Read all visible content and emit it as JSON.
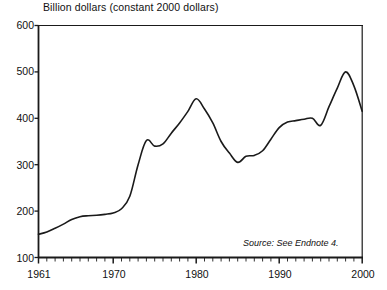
{
  "chart_data": {
    "type": "line",
    "title": "Billion dollars (constant 2000 dollars)",
    "xlabel": "",
    "ylabel": "",
    "xlim": [
      1961,
      2000
    ],
    "ylim": [
      100,
      600
    ],
    "yticks": [
      100,
      200,
      300,
      400,
      500,
      600
    ],
    "ytick_labels": [
      "100",
      "200",
      "300",
      "400",
      "500",
      "600"
    ],
    "xticks": [
      1961,
      1970,
      1980,
      1990,
      2000
    ],
    "xtick_labels": [
      "1961",
      "1970",
      "1980",
      "1990",
      "2000"
    ],
    "minor_xticks_every": 1,
    "grid": false,
    "legend": null,
    "line_color": "#1a1a1a",
    "line_width": 1.6,
    "annotation": "Source: See Endnote 4.",
    "x": [
      1961,
      1962,
      1963,
      1964,
      1965,
      1966,
      1967,
      1968,
      1969,
      1970,
      1971,
      1972,
      1973,
      1974,
      1975,
      1976,
      1977,
      1978,
      1979,
      1980,
      1981,
      1982,
      1983,
      1984,
      1985,
      1986,
      1987,
      1988,
      1989,
      1990,
      1991,
      1992,
      1993,
      1994,
      1995,
      1996,
      1997,
      1998,
      1999,
      2000
    ],
    "values": [
      150,
      155,
      163,
      172,
      182,
      188,
      190,
      191,
      193,
      196,
      205,
      232,
      300,
      352,
      340,
      345,
      368,
      390,
      415,
      442,
      420,
      390,
      350,
      325,
      305,
      318,
      320,
      330,
      355,
      380,
      392,
      395,
      398,
      400,
      385,
      425,
      465,
      500,
      470,
      415
    ],
    "series": [
      {
        "name": "Billion dollars (constant 2000 dollars)",
        "values": [
          150,
          155,
          163,
          172,
          182,
          188,
          190,
          191,
          193,
          196,
          205,
          232,
          300,
          352,
          340,
          345,
          368,
          390,
          415,
          442,
          420,
          390,
          350,
          325,
          305,
          318,
          320,
          330,
          355,
          380,
          392,
          395,
          398,
          400,
          385,
          425,
          465,
          500,
          470,
          415
        ]
      }
    ]
  },
  "axes": {
    "ytick_labels": [
      "600",
      "500",
      "400",
      "300",
      "200",
      "100"
    ],
    "xtick_labels": [
      "1961",
      "1970",
      "1980",
      "1990",
      "2000"
    ]
  },
  "text": {
    "title": "Billion dollars (constant 2000 dollars)",
    "source": "Source: See Endnote 4."
  }
}
